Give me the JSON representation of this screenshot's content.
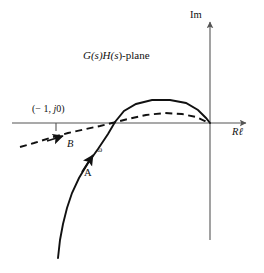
{
  "figure": {
    "title": "G(s)H(s)-plane",
    "title_parts": {
      "g": "G(",
      "s1": "s",
      "h": ")H(",
      "s2": "s",
      "tail": ")-plane"
    },
    "background_color": "#ffffff",
    "ink_color": "#111111",
    "axis_color": "#555555"
  },
  "axes": {
    "imaginary_label": "Im",
    "real_label": "Rℓ",
    "real_axis": {
      "x1": 12,
      "x2": 250,
      "y": 123
    },
    "imaginary_axis": {
      "x": 210,
      "y1": 18,
      "y2": 240
    },
    "origin": {
      "x": 210,
      "y": 123
    }
  },
  "annotations": {
    "critical_point": {
      "text": "(− 1, j0)",
      "lead": "(− 1, ",
      "j": "j",
      "tail": "0)",
      "tick_x": 56,
      "tick_y": 123
    },
    "branch_b": {
      "label": "B",
      "x": 67,
      "y": 139
    },
    "branch_a": {
      "label": "A",
      "x": 84,
      "y": 168
    },
    "omega": {
      "label": "ω",
      "x": 97,
      "y": 146
    }
  },
  "chart_data": {
    "type": "line",
    "title": "G(s)H(s)-plane",
    "xlabel": "Rℓ",
    "ylabel": "Im",
    "grid": false,
    "legend": null,
    "annotations": [
      {
        "text": "(− 1, j0)",
        "type": "critical-point"
      },
      {
        "text": "A",
        "type": "solid-branch-label"
      },
      {
        "text": "B",
        "type": "dashed-branch-label"
      },
      {
        "text": "ω",
        "type": "direction-of-increasing-frequency"
      }
    ],
    "series": [
      {
        "name": "A",
        "style": "solid",
        "points": [
          [
            58,
            258
          ],
          [
            60,
            240
          ],
          [
            63,
            224
          ],
          [
            67,
            208
          ],
          [
            72,
            193
          ],
          [
            79,
            178
          ],
          [
            88,
            163
          ],
          [
            98,
            149
          ],
          [
            108,
            134
          ],
          [
            115,
            122
          ],
          [
            124,
            111
          ],
          [
            136,
            104
          ],
          [
            152,
            100
          ],
          [
            170,
            100
          ],
          [
            186,
            103
          ],
          [
            198,
            110
          ],
          [
            206,
            118
          ],
          [
            210,
            123
          ]
        ]
      },
      {
        "name": "B",
        "style": "dashed",
        "points": [
          [
            20,
            147
          ],
          [
            34,
            143
          ],
          [
            50,
            138
          ],
          [
            68,
            133
          ],
          [
            86,
            129
          ],
          [
            100,
            126
          ],
          [
            112,
            123
          ],
          [
            128,
            119
          ],
          [
            146,
            115
          ],
          [
            165,
            113
          ],
          [
            182,
            114
          ],
          [
            196,
            117
          ],
          [
            205,
            121
          ],
          [
            210,
            123
          ]
        ]
      }
    ],
    "arrows": [
      {
        "on": "A",
        "x": 90,
        "y": 160,
        "dir_deg": -56,
        "meaning": "increasing ω"
      },
      {
        "on": "B",
        "x": 60,
        "y": 135,
        "dir_deg": -16,
        "meaning": "increasing ω"
      }
    ]
  }
}
